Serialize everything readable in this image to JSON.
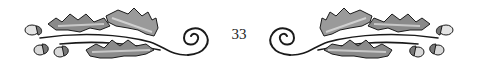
{
  "page": {
    "number": "33"
  },
  "ornament": {
    "left_icon": "oak-leaf-acorn-vine-icon",
    "right_icon": "oak-leaf-acorn-vine-icon",
    "colors": {
      "stroke": "#1a1a1a",
      "leaf_fill": "#8a8a8a",
      "leaf_light": "#c8c8c8",
      "acorn_fill": "#d8d8d8"
    }
  }
}
